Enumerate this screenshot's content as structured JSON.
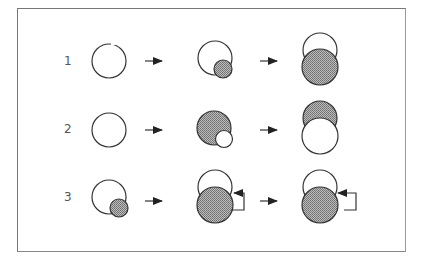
{
  "diagram": {
    "rows": [
      {
        "label": "1"
      },
      {
        "label": "2"
      },
      {
        "label": "3"
      }
    ],
    "colors": {
      "stroke": "#333333",
      "fill_shaded": "#9a9a9a",
      "frame": "#777777"
    }
  }
}
